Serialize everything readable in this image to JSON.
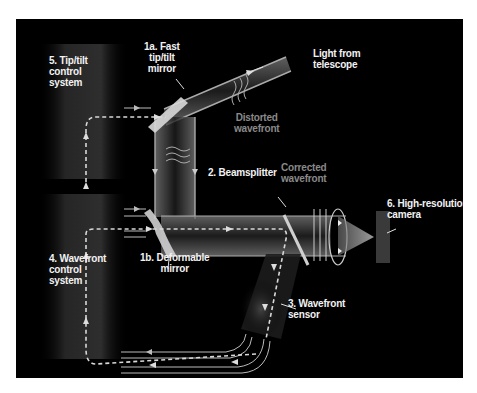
{
  "diagram": {
    "background_color": "#000000",
    "page_color": "#ffffff",
    "labels": {
      "tip_tilt_control": [
        "5. Tip/tilt",
        "control",
        "system"
      ],
      "fast_tip_tilt_mirror": [
        "1a. Fast",
        "tip/tilt",
        "mirror"
      ],
      "light_from_telescope": [
        "Light from",
        "telescope"
      ],
      "distorted_wavefront": [
        "Distorted",
        "wavefront"
      ],
      "beamsplitter": [
        "2. Beamsplitter"
      ],
      "corrected_wavefront": [
        "Corrected",
        "wavefront"
      ],
      "high_resolution_camera": [
        "6. High-resolution",
        "camera"
      ],
      "wavefront_control": [
        "4. Wavefront",
        "control",
        "system"
      ],
      "deformable_mirror": [
        "1b. Deformable",
        "mirror"
      ],
      "wavefront_sensor": [
        "3. Wavefront",
        "sensor"
      ]
    },
    "colors": {
      "label_text": "#f2f2f2",
      "secondary_text": "#8a8a8a",
      "beam": "#9a9a9a",
      "control_line": "#cfcfcf"
    }
  }
}
